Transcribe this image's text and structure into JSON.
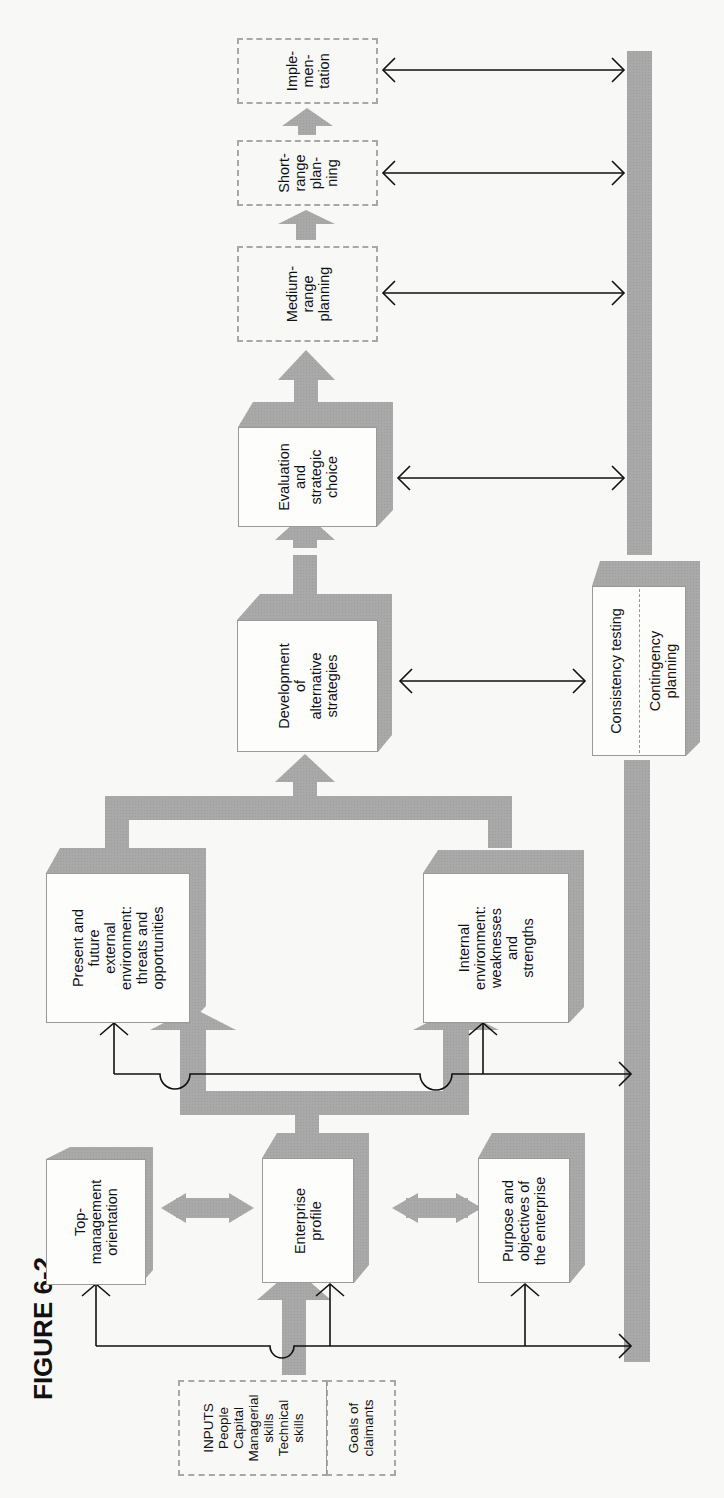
{
  "figure": {
    "title": "FIGURE 6-2"
  },
  "inputs": {
    "resources_label": "INPUTS\nPeople\nCapital\nManagerial\nskills\nTechnical\nskills",
    "goals_label": "Goals of\nclaimants"
  },
  "nodes": {
    "top_management": "Top-\nmanagement\norientation",
    "enterprise_profile": "Enterprise\nprofile",
    "purpose_objectives": "Purpose and\nobjectives of\nthe enterprise",
    "external_environment": "Present and\nfuture\nexternal\nenvironment:\nthreats and\nopportunities",
    "internal_environment": "Internal\nenvironment:\nweaknesses\nand\nstrengths",
    "alternative_strategies": "Development\nof\nalternative\nstrategies",
    "evaluation_choice": "Evaluation\nand\nstrategic\nchoice",
    "medium_range": "Medium-\nrange\nplanning",
    "short_range": "Short-\nrange\nplan-\nning",
    "implementation": "Imple-\nmen-\ntation",
    "consistency_testing": "Consistency testing",
    "contingency_planning": "Contingency\nplanning"
  },
  "colors": {
    "shadow_gray": "#a9a9a9",
    "arrow_gray": "#a5a5a5",
    "line": "#111111",
    "dashed_border": "#a8a8a8"
  }
}
